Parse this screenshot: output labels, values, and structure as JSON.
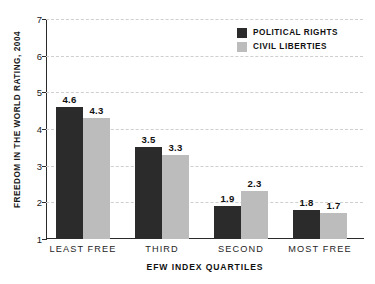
{
  "chart_data": {
    "type": "bar",
    "title": "",
    "xlabel": "EFW INDEX QUARTILES",
    "ylabel": "FREEDOM IN THE WORLD RATING, 2004",
    "categories": [
      "LEAST FREE",
      "THIRD",
      "SECOND",
      "MOST FREE"
    ],
    "series": [
      {
        "name": "POLITICAL RIGHTS",
        "color": "#2b2b2b",
        "values": [
          4.6,
          4.3,
          3.5,
          3.3
        ]
      },
      {
        "name": "CIVIL LIBERTIES",
        "color": "#bcbcbc",
        "values": [
          1.9,
          2.3,
          1.8,
          1.7
        ]
      }
    ],
    "groups": [
      {
        "category": "LEAST FREE",
        "political_rights": 4.6,
        "civil_liberties": 4.3
      },
      {
        "category": "THIRD",
        "political_rights": 3.5,
        "civil_liberties": 3.3
      },
      {
        "category": "SECOND",
        "political_rights": 1.9,
        "civil_liberties": 2.3
      },
      {
        "category": "MOST FREE",
        "political_rights": 1.8,
        "civil_liberties": 1.7
      }
    ],
    "ylim": [
      1,
      7
    ],
    "yticks": [
      1,
      2,
      3,
      4,
      5,
      6,
      7
    ],
    "ytick_labels": [
      "1",
      "2",
      "3",
      "4",
      "5",
      "6",
      "7"
    ],
    "grid": true,
    "grid_axis": "y",
    "grid_style": "dashed",
    "grid_color": "#cfcfcf",
    "legend_position": "top-right",
    "value_labels": [
      "4.6",
      "4.3",
      "3.5",
      "3.3",
      "1.9",
      "2.3",
      "1.8",
      "1.7"
    ]
  },
  "legend": {
    "entries": [
      {
        "label": "POLITICAL RIGHTS",
        "color": "#2b2b2b"
      },
      {
        "label": "CIVIL LIBERTIES",
        "color": "#bcbcbc"
      }
    ]
  },
  "axes": {
    "y_title": "FREEDOM IN THE WORLD RATING, 2004",
    "x_title": "EFW INDEX QUARTILES"
  }
}
